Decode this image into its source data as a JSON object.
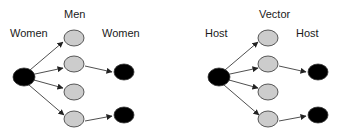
{
  "diagrams": [
    {
      "source_label": "Women",
      "middle_label": "Men",
      "target_label": "Women"
    },
    {
      "source_label": "Host",
      "middle_label": "Vector",
      "target_label": "Host"
    }
  ],
  "colors": {
    "infected_fill": "#000000",
    "uninfected_fill": "#cccccc",
    "stroke": "#333333"
  }
}
